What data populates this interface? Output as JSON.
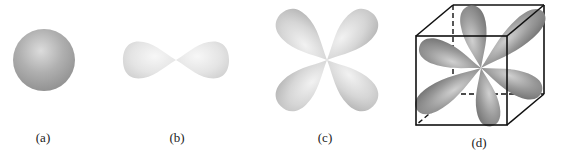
{
  "figure": {
    "panels": [
      {
        "id": "a",
        "label": "(a)",
        "shape": "sphere",
        "description": "s orbital"
      },
      {
        "id": "b",
        "label": "(b)",
        "shape": "dumbbell",
        "description": "p orbital"
      },
      {
        "id": "c",
        "label": "(c)",
        "shape": "four-leaf clover",
        "description": "d orbital"
      },
      {
        "id": "d",
        "label": "(d)",
        "shape": "lobes inside cube",
        "description": "d orbitals in cubic field"
      }
    ],
    "colors": {
      "background": "#ffffff",
      "sphere_mid": "#a8a8a8",
      "lobe_light": "#ececec",
      "lobe_mid": "#c8c8c8",
      "lobe_dark": "#7a7a7a",
      "cube_line": "#111111"
    }
  }
}
